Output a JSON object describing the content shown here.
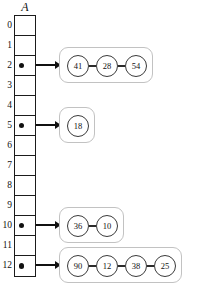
{
  "diagram": {
    "array_label": "A",
    "array": {
      "name": "A",
      "size": 13,
      "indices": [
        "0",
        "1",
        "2",
        "3",
        "4",
        "5",
        "6",
        "7",
        "8",
        "9",
        "10",
        "11",
        "12"
      ]
    },
    "chains": [
      {
        "slot": "2",
        "values": [
          "41",
          "28",
          "54"
        ]
      },
      {
        "slot": "5",
        "values": [
          "18"
        ]
      },
      {
        "slot": "10",
        "values": [
          "36",
          "10"
        ]
      },
      {
        "slot": "12",
        "values": [
          "90",
          "12",
          "38",
          "25"
        ]
      }
    ],
    "colors": {
      "stroke": "#1b1b1b",
      "node_stroke": "#3a3a3a",
      "chain_border": "#c2c2c2",
      "pointer": "#111111",
      "background": "#ffffff"
    }
  }
}
